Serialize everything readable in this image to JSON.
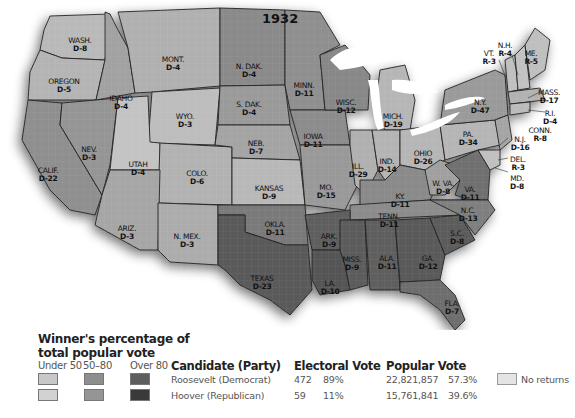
{
  "map": {
    "title": "1932",
    "states": [
      {
        "abbr": "WASH.",
        "ev": "D-8",
        "x": 80,
        "y": 37
      },
      {
        "abbr": "OREGON",
        "ev": "D-5",
        "x": 64,
        "y": 78
      },
      {
        "abbr": "IDAHO",
        "ev": "D-4",
        "x": 121,
        "y": 95
      },
      {
        "abbr": "MONT.",
        "ev": "D-4",
        "x": 173,
        "y": 56
      },
      {
        "abbr": "WYO.",
        "ev": "D-3",
        "x": 185,
        "y": 113
      },
      {
        "abbr": "N. DAK.",
        "ev": "D-4",
        "x": 249,
        "y": 63
      },
      {
        "abbr": "S. DAK.",
        "ev": "D-4",
        "x": 249,
        "y": 101
      },
      {
        "abbr": "NEB.",
        "ev": "D-7",
        "x": 256,
        "y": 140
      },
      {
        "abbr": "NEV.",
        "ev": "D-3",
        "x": 89,
        "y": 146
      },
      {
        "abbr": "UTAH",
        "ev": "D-4",
        "x": 138,
        "y": 161
      },
      {
        "abbr": "COLO.",
        "ev": "D-6",
        "x": 197,
        "y": 170
      },
      {
        "abbr": "KANSAS",
        "ev": "D-9",
        "x": 269,
        "y": 185
      },
      {
        "abbr": "CALIF.",
        "ev": "D-22",
        "x": 48,
        "y": 167
      },
      {
        "abbr": "ARIZ.",
        "ev": "D-3",
        "x": 127,
        "y": 225
      },
      {
        "abbr": "N. MEX.",
        "ev": "D-3",
        "x": 187,
        "y": 233
      },
      {
        "abbr": "OKLA.",
        "ev": "D-11",
        "x": 275,
        "y": 221
      },
      {
        "abbr": "TEXAS",
        "ev": "D-23",
        "x": 262,
        "y": 275
      },
      {
        "abbr": "MINN.",
        "ev": "D-11",
        "x": 304,
        "y": 82
      },
      {
        "abbr": "IOWA",
        "ev": "D-11",
        "x": 313,
        "y": 133
      },
      {
        "abbr": "WISC.",
        "ev": "D-12",
        "x": 346,
        "y": 99
      },
      {
        "abbr": "MICH.",
        "ev": "D-19",
        "x": 393,
        "y": 113
      },
      {
        "abbr": "ILL.",
        "ev": "D-29",
        "x": 358,
        "y": 163
      },
      {
        "abbr": "IND.",
        "ev": "D-14",
        "x": 387,
        "y": 158
      },
      {
        "abbr": "OHIO",
        "ev": "D-26",
        "x": 423,
        "y": 150
      },
      {
        "abbr": "MO.",
        "ev": "D-15",
        "x": 326,
        "y": 184
      },
      {
        "abbr": "KY.",
        "ev": "D-11",
        "x": 400,
        "y": 193
      },
      {
        "abbr": "W. VA.",
        "ev": "D-8",
        "x": 443,
        "y": 180
      },
      {
        "abbr": "VA.",
        "ev": "D-11",
        "x": 470,
        "y": 186
      },
      {
        "abbr": "TENN.",
        "ev": "D-11",
        "x": 389,
        "y": 213
      },
      {
        "abbr": "N.C.",
        "ev": "D-13",
        "x": 468,
        "y": 207
      },
      {
        "abbr": "ARK.",
        "ev": "D-9",
        "x": 329,
        "y": 233
      },
      {
        "abbr": "MISS.",
        "ev": "D-9",
        "x": 352,
        "y": 256
      },
      {
        "abbr": "ALA.",
        "ev": "D-11",
        "x": 387,
        "y": 255
      },
      {
        "abbr": "GA.",
        "ev": "D-12",
        "x": 428,
        "y": 255
      },
      {
        "abbr": "S.C.",
        "ev": "D-8",
        "x": 457,
        "y": 230
      },
      {
        "abbr": "LA.",
        "ev": "D-10",
        "x": 330,
        "y": 280
      },
      {
        "abbr": "FLA.",
        "ev": "D-7",
        "x": 452,
        "y": 300
      },
      {
        "abbr": "PA.",
        "ev": "D-34",
        "x": 468,
        "y": 131
      },
      {
        "abbr": "N.Y.",
        "ev": "D-47",
        "x": 480,
        "y": 99
      },
      {
        "abbr": "VT.",
        "ev": "R-3",
        "x": 489,
        "y": 50
      },
      {
        "abbr": "N.H.",
        "ev": "R-4",
        "x": 505,
        "y": 42
      },
      {
        "abbr": "ME.",
        "ev": "R-5",
        "x": 531,
        "y": 50
      },
      {
        "abbr": "MASS.",
        "ev": "D-17",
        "x": 549,
        "y": 89
      },
      {
        "abbr": "R.I.",
        "ev": "D-4",
        "x": 550,
        "y": 110
      },
      {
        "abbr": "CONN.",
        "ev": "R-8",
        "x": 540,
        "y": 127
      },
      {
        "abbr": "N.J.",
        "ev": "D-16",
        "x": 520,
        "y": 136
      },
      {
        "abbr": "DEL.",
        "ev": "R-3",
        "x": 518,
        "y": 156
      },
      {
        "abbr": "MD.",
        "ev": "D-8",
        "x": 517,
        "y": 175
      }
    ]
  },
  "legend": {
    "title_line1": "Winner's percentage of",
    "title_line2": "total popular vote",
    "columns": [
      "Under 50",
      "50–80",
      "Over 80"
    ],
    "colors": {
      "roosevelt": [
        "#c8c8c8",
        "#8e8e8e",
        "#5e5e5e"
      ],
      "hoover": [
        "#d2d2d2",
        "#959595",
        "#3a3a3a"
      ],
      "no_returns": "#e4e4e4"
    },
    "no_returns_label": "No returns"
  },
  "results": {
    "headers": {
      "candidate": "Candidate (Party)",
      "electoral": "Electoral Vote",
      "popular": "Popular Vote"
    },
    "rows": [
      {
        "candidate": "Roosevelt (Democrat)",
        "ev": "472",
        "ev_pct": "89%",
        "pv": "22,821,857",
        "pv_pct": "57.3%"
      },
      {
        "candidate": "Hoover (Republican)",
        "ev": "59",
        "ev_pct": "11%",
        "pv": "15,761,841",
        "pv_pct": "39.6%"
      }
    ]
  }
}
